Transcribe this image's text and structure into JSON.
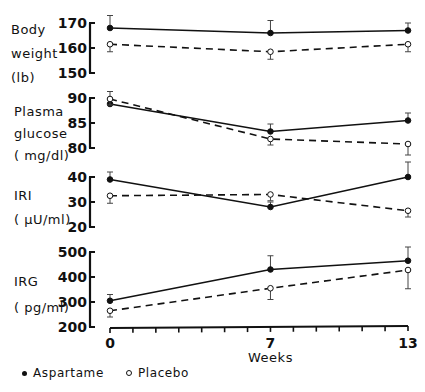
{
  "chart_data": {
    "type": "line",
    "title": "",
    "xlabel": "Weeks",
    "x": [
      0,
      7,
      13
    ],
    "x_ticks_labeled": [
      "0",
      "7",
      "13"
    ],
    "x_range": [
      0,
      13
    ],
    "legend": [
      {
        "name": "Aspartame",
        "marker": "filled-circle",
        "line": "solid"
      },
      {
        "name": "Placebo",
        "marker": "open-circle",
        "line": "dashed"
      }
    ],
    "legend_position": "bottom-left",
    "panels": [
      {
        "ylabel_lines": [
          "Body",
          "weight",
          "(lb)"
        ],
        "ylim": [
          150,
          170
        ],
        "yticks": [
          150,
          160,
          170
        ],
        "series": [
          {
            "name": "Aspartame",
            "values": [
              168,
              166,
              167
            ],
            "errors": [
              5,
              5,
              3
            ]
          },
          {
            "name": "Placebo",
            "values": [
              161.5,
              158.5,
              161.5
            ],
            "errors": [
              3,
              3,
              3
            ]
          }
        ]
      },
      {
        "ylabel_lines": [
          "Plasma",
          "glucose",
          "(mg/dl)"
        ],
        "ylim": [
          80,
          90
        ],
        "yticks": [
          80,
          85,
          90
        ],
        "series": [
          {
            "name": "Aspartame",
            "values": [
              88.8,
              83.3,
              85.5
            ],
            "errors": [
              2.5,
              1.5,
              1.5
            ]
          },
          {
            "name": "Placebo",
            "values": [
              89.8,
              81.8,
              80.8
            ],
            "errors": [
              1.2,
              1.2,
              2.2
            ]
          }
        ]
      },
      {
        "ylabel_lines": [
          "IRI",
          "(μU/ml)"
        ],
        "ylim": [
          20,
          40
        ],
        "yticks": [
          20,
          30,
          40
        ],
        "series": [
          {
            "name": "Aspartame",
            "values": [
              39,
              28,
              40
            ],
            "errors": [
              3,
              2,
              6
            ]
          },
          {
            "name": "Placebo",
            "values": [
              32.5,
              33,
              26.5
            ],
            "errors": [
              3,
              2.5,
              2.5
            ]
          }
        ]
      },
      {
        "ylabel_lines": [
          "IRG",
          "(pg/ml)"
        ],
        "ylim": [
          200,
          500
        ],
        "yticks": [
          200,
          300,
          400,
          500
        ],
        "series": [
          {
            "name": "Aspartame",
            "values": [
              305,
              430,
              465
            ],
            "errors": [
              25,
              55,
              55
            ]
          },
          {
            "name": "Placebo",
            "values": [
              265,
              355,
              428
            ],
            "errors": [
              25,
              45,
              75
            ]
          }
        ]
      }
    ]
  },
  "labels": {
    "panel0": {
      "l0": "Body",
      "l1": "weight",
      "l2": "(lb)"
    },
    "panel1": {
      "l0": "Plasma",
      "l1": "glucose",
      "l2": "( mg/dl)"
    },
    "panel2": {
      "l0": "IRI",
      "l1": "( μU/ml)"
    },
    "panel3": {
      "l0": "IRG",
      "l1": "( pg/ml)"
    },
    "x_title": "Weeks",
    "legend_aspartame": "Aspartame",
    "legend_placebo": "Placebo"
  },
  "layout": {
    "axis_x": 90,
    "x0_px": 110,
    "x13_px": 408,
    "panels_px": [
      {
        "ytop": 23,
        "ybottom": 73
      },
      {
        "ytop": 98,
        "ybottom": 148
      },
      {
        "ytop": 177,
        "ybottom": 227
      },
      {
        "ytop": 252,
        "ybottom": 327
      }
    ],
    "xaxis_y": 327,
    "ink_color": "#111111"
  }
}
